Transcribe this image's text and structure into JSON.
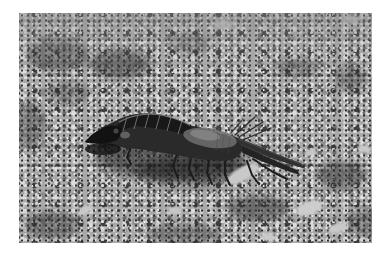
{
  "photo": {
    "alt": "Black-and-white photograph of a mole cricket standing on coarse sandy ground strewn with pebbles and plant debris, facing left with pointed folded wings extending toward the lower right",
    "subject": "mole cricket insect",
    "orientation": "facing left",
    "style": "black-and-white print with white border",
    "elements": {
      "insect": "dark insect with segmented armored thorax plates, sheened rounded abdomen, thin legs, rear bristles and pointed folded wings",
      "ground": "mottled sand and gravel with dark debris patches",
      "leaf": "pale leaf fragment beneath the insect's hind end",
      "pebbles": "scattered pale pebbles"
    },
    "palette": {
      "frame": "#ffffff",
      "ground_base": "#a9a9a9",
      "ground_dark": "#2f2f2f",
      "ground_light": "#d9d9d9",
      "insect_body": "#262626",
      "insect_sheen": "#6f6f6f"
    }
  }
}
